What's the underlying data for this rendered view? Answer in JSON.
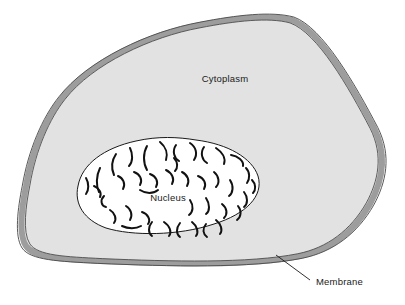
{
  "diagram": {
    "type": "biological-cell-schematic",
    "background_color": "#ffffff"
  },
  "labels": {
    "cytoplasm": "Cytoplasm",
    "nucleus": "Nucleus",
    "membrane": "Membrane"
  },
  "colors": {
    "cytoplasm_fill": "#e2e2e2",
    "membrane_band": "#9d9d9d",
    "membrane_outline": "#4a4a4a",
    "nucleus_fill": "#ffffff",
    "nucleus_outline": "#1a1a1a",
    "chromatin": "#111111",
    "leader_line": "#1a1a1a",
    "text": "#1a1a1a"
  },
  "structures": [
    {
      "name": "membrane",
      "description": "Thick gray band forming the irregular outer boundary of the cell",
      "label": "Membrane"
    },
    {
      "name": "cytoplasm",
      "description": "Light gray interior region between the membrane and the nucleus",
      "label": "Cytoplasm"
    },
    {
      "name": "nucleus",
      "description": "White egg-shaped organelle containing scattered curved chromatin strands",
      "label": "Nucleus"
    }
  ],
  "geometry": {
    "cell_outline_path": "M 292,20 C 320,30 352,86 374,128 C 388,156 382,182 370,204 C 354,232 330,250 300,256 C 250,266 170,264 100,261 C 62,259 34,258 26,246 C 18,234 22,206 26,186 C 32,150 46,118 62,98 C 90,62 150,34 200,25 C 236,18 270,14 292,20 Z",
    "nucleus_outline_path": "M 196,140 C 228,144 252,158 258,176 C 264,196 246,214 214,224 C 178,236 132,236 106,228 C 84,220 74,204 78,186 C 82,164 104,148 136,141 C 158,136 178,137 196,140 Z",
    "membrane_leader_line": "M 276,255 L 310,280",
    "label_positions": {
      "cytoplasm": {
        "x": 225,
        "y": 82
      },
      "nucleus": {
        "x": 168,
        "y": 201
      },
      "membrane": {
        "x": 316,
        "y": 285
      }
    }
  },
  "chromatin_strands": [
    {
      "d": "M 104,196 C 100,200 101,206 106,207"
    },
    {
      "d": "M 100,168 C 96,176 96,186 99,192"
    },
    {
      "d": "M 116,154 C 112,160 111,168 114,175"
    },
    {
      "d": "M 130,148 C 133,154 133,162 129,166"
    },
    {
      "d": "M 147,146 C 143,153 143,163 147,170"
    },
    {
      "d": "M 160,142 C 166,147 168,154 166,160"
    },
    {
      "d": "M 176,145 C 172,151 174,158 179,161"
    },
    {
      "d": "M 190,143 C 196,147 198,154 194,160"
    },
    {
      "d": "M 204,147 C 200,153 202,160 207,163"
    },
    {
      "d": "M 216,148 C 222,152 226,158 224,164"
    },
    {
      "d": "M 231,155 C 238,156 244,161 243,166"
    },
    {
      "d": "M 246,168 C 250,172 250,179 247,183"
    },
    {
      "d": "M 118,176 C 123,178 126,184 123,189"
    },
    {
      "d": "M 134,172 C 140,174 143,180 140,185"
    },
    {
      "d": "M 150,174 C 156,176 159,182 156,187"
    },
    {
      "d": "M 166,170 C 172,173 175,179 172,184"
    },
    {
      "d": "M 182,172 C 188,175 190,181 187,186"
    },
    {
      "d": "M 198,176 C 204,178 207,184 204,189"
    },
    {
      "d": "M 214,172 C 219,176 220,183 216,187"
    },
    {
      "d": "M 230,180 C 234,186 233,193 229,196"
    },
    {
      "d": "M 244,192 C 248,197 248,204 244,207"
    },
    {
      "d": "M 110,210 C 115,213 117,219 114,223"
    },
    {
      "d": "M 126,206 C 131,209 133,215 130,220"
    },
    {
      "d": "M 142,212 C 148,214 151,220 148,224"
    },
    {
      "d": "M 190,200 C 194,206 193,212 189,215"
    },
    {
      "d": "M 206,198 C 210,204 210,211 206,214"
    },
    {
      "d": "M 222,204 C 227,208 228,214 224,218"
    },
    {
      "d": "M 238,206 C 242,211 241,217 237,220"
    },
    {
      "d": "M 122,226 C 128,229 136,229 141,226"
    },
    {
      "d": "M 152,222 C 148,227 148,233 152,236"
    },
    {
      "d": "M 164,222 C 170,226 172,232 169,236"
    },
    {
      "d": "M 180,223 C 176,228 176,234 180,237"
    },
    {
      "d": "M 192,222 C 197,226 199,232 196,236"
    },
    {
      "d": "M 206,224 C 202,229 203,234 207,237"
    },
    {
      "d": "M 216,220 C 221,224 223,230 220,234"
    },
    {
      "d": "M 140,190 C 146,194 153,194 158,190"
    },
    {
      "d": "M 94,186 C 99,188 102,193 100,197"
    },
    {
      "d": "M 86,178 C 89,183 89,190 86,194"
    },
    {
      "d": "M 252,180 C 256,184 256,190 253,193"
    },
    {
      "d": "M 174,158 C 178,162 178,168 175,171"
    }
  ]
}
